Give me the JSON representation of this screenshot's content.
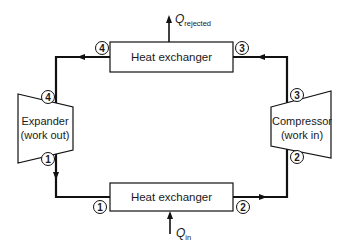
{
  "diagram": {
    "type": "closed-loop thermodynamic cycle (heat engine)",
    "components": {
      "top_heat_exchanger": {
        "label": "Heat exchanger"
      },
      "bottom_heat_exchanger": {
        "label": "Heat exchanger"
      },
      "expander": {
        "line1": "Expander",
        "line2": "(work out)"
      },
      "compressor": {
        "line1": "Compressor",
        "line2": "(work in)"
      }
    },
    "heat_flows": {
      "rejected": {
        "symbol": "Q",
        "subscript": "rejected",
        "direction": "up-out"
      },
      "input": {
        "symbol": "Q",
        "subscript": "in",
        "direction": "up-in"
      }
    },
    "state_points": {
      "top_left": "4",
      "expander_in": "4",
      "top_right": "3",
      "compressor_out": "3",
      "expander_out": "1",
      "bottom_left": "1",
      "bottom_right": "2",
      "compressor_in": "2"
    },
    "flow": [
      "1",
      "2",
      "3",
      "4"
    ],
    "colors": {
      "line": "#111111",
      "background": "#ffffff"
    }
  }
}
